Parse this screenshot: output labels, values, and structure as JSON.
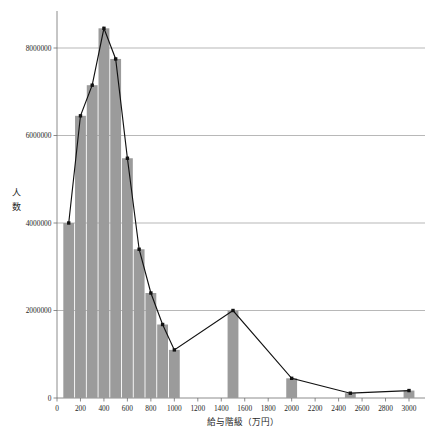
{
  "chart_data": {
    "type": "bar",
    "title": "",
    "subtitle": "",
    "xlabel": "給与階級（万円）",
    "ylabel": "人数",
    "xlim": [
      0,
      3000
    ],
    "ylim": [
      0,
      8800000
    ],
    "grid": true,
    "legend": null,
    "legend_position": "none",
    "x_ticks": [
      0,
      200,
      400,
      600,
      800,
      1000,
      1200,
      1400,
      1600,
      1800,
      2000,
      2200,
      2400,
      2600,
      2800,
      3000
    ],
    "x_tick_labels": [
      "0",
      "200",
      "400",
      "600",
      "800",
      "1000",
      "1200",
      "1400",
      "1600",
      "1800",
      "2000",
      "2200",
      "2400",
      "2600",
      "2800",
      "3000"
    ],
    "y_ticks": [
      0,
      2000000,
      4000000,
      6000000,
      8000000
    ],
    "y_tick_labels": [
      "0",
      "2000000",
      "4000000",
      "6000000",
      "8000000"
    ],
    "bar_color": "#9b9b9b",
    "line_color": "#111111",
    "marker_color": "#111111",
    "categories": [
      100,
      200,
      300,
      400,
      500,
      600,
      700,
      800,
      900,
      1000,
      1500,
      2000,
      2500,
      3000
    ],
    "category_labels": [
      "100",
      "200",
      "300",
      "400",
      "500",
      "600",
      "700",
      "800",
      "900",
      "1000",
      "1500",
      "2000",
      "2500",
      "3000"
    ],
    "bar_widths": [
      100,
      100,
      100,
      100,
      100,
      100,
      100,
      100,
      100,
      100,
      100,
      100,
      100,
      100
    ],
    "values": [
      4000000,
      6450000,
      7150000,
      8450000,
      7750000,
      5480000,
      3400000,
      2400000,
      1680000,
      1100000,
      2000000,
      450000,
      110000,
      170000
    ],
    "series": [
      {
        "name": "人数",
        "kind": "bar+line",
        "values": [
          4000000,
          6450000,
          7150000,
          8450000,
          7750000,
          5480000,
          3400000,
          2400000,
          1680000,
          1100000,
          2000000,
          450000,
          110000,
          170000
        ]
      }
    ]
  }
}
